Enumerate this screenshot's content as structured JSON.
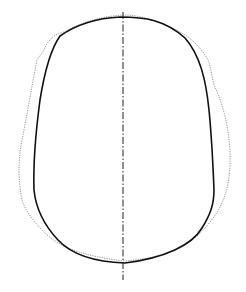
{
  "diagram": {
    "type": "outline-comparison",
    "background": "#ffffff",
    "midline": {
      "x": 123,
      "y1": 12,
      "y2": 280,
      "color": "#222222",
      "style": "dash-dot"
    },
    "solid_outline": {
      "color": "#111111",
      "width": 1.6,
      "path": "M 60 36 C 80 22, 100 18, 120 17 C 145 17, 165 20, 185 38 C 200 55, 206 80, 209 110 C 212 140, 213 165, 214 190 C 214 205, 210 215, 202 228 C 192 245, 165 258, 125 263 C 95 262, 72 255, 58 240 C 44 225, 36 210, 34 190 C 33 160, 36 130, 40 100 C 44 75, 50 50, 60 36 Z"
    },
    "dotted_outline": {
      "color": "#8a8a8a",
      "width": 0.9,
      "path": "M 64 32 C 54 34, 48 40, 44 50 L 37 60 C 32 85, 27 115, 22 140 C 18 160, 18 180, 22 200 C 26 212, 34 222, 44 232 C 58 246, 80 256, 125 261 C 165 258, 192 246, 210 222 C 222 208, 229 190, 230 165 C 231 140, 226 110, 214 85 L 209 62 C 202 48, 190 37, 180 32 C 162 22, 142 16, 128 15 C 105 15, 82 22, 64 32 Z"
    }
  }
}
